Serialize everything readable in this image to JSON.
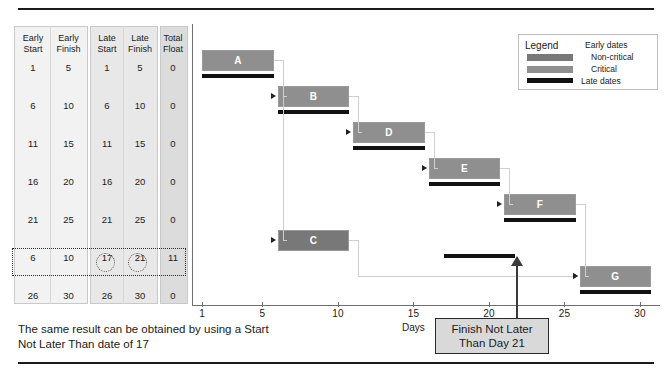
{
  "table": {
    "groups": [
      {
        "name": "early",
        "headers": [
          "Early Start",
          "Early Finish"
        ]
      },
      {
        "name": "late",
        "headers": [
          "Late Start",
          "Late Finish"
        ]
      },
      {
        "name": "float",
        "headers": [
          "Total Float"
        ]
      }
    ],
    "headers": {
      "early_start_l1": "Early",
      "early_start_l2": "Start",
      "early_finish_l1": "Early",
      "early_finish_l2": "Finish",
      "late_start_l1": "Late",
      "late_start_l2": "Start",
      "late_finish_l1": "Late",
      "late_finish_l2": "Finish",
      "total_float_l1": "Total",
      "total_float_l2": "Float"
    },
    "rows": [
      {
        "task": "A",
        "early_start": "1",
        "early_finish": "5",
        "late_start": "1",
        "late_finish": "5",
        "total_float": "0",
        "highlighted": false
      },
      {
        "task": "B",
        "early_start": "6",
        "early_finish": "10",
        "late_start": "6",
        "late_finish": "10",
        "total_float": "0",
        "highlighted": false
      },
      {
        "task": "D",
        "early_start": "11",
        "early_finish": "15",
        "late_start": "11",
        "late_finish": "15",
        "total_float": "0",
        "highlighted": false
      },
      {
        "task": "E",
        "early_start": "16",
        "early_finish": "20",
        "late_start": "16",
        "late_finish": "20",
        "total_float": "0",
        "highlighted": false
      },
      {
        "task": "F",
        "early_start": "21",
        "early_finish": "25",
        "late_start": "21",
        "late_finish": "25",
        "total_float": "0",
        "highlighted": false
      },
      {
        "task": "C",
        "early_start": "6",
        "early_finish": "10",
        "late_start": "17",
        "late_finish": "21",
        "total_float": "11",
        "highlighted": true
      },
      {
        "task": "G",
        "early_start": "26",
        "early_finish": "30",
        "late_start": "26",
        "late_finish": "30",
        "total_float": "0",
        "highlighted": false
      }
    ]
  },
  "legend": {
    "title": "Legend",
    "early_dates": "Early dates",
    "non_critical": "Non-critical",
    "critical": "Critical",
    "late_dates": "Late dates",
    "color_non_critical": "#787878",
    "color_critical": "#8f8f8f",
    "color_late": "#111111"
  },
  "callout": {
    "line1": "Finish Not Later",
    "line2": "Than Day 21"
  },
  "note": {
    "line1": "The same result can be obtained by using a",
    "line2": "Start Not Later Than date of 17"
  },
  "chart_data": {
    "type": "bar",
    "title": "",
    "xlabel": "Days",
    "ylabel": "",
    "xlim": [
      1,
      30
    ],
    "grid": false,
    "legend_position": "top-right",
    "axis_ticks": [
      "1",
      "5",
      "10",
      "15",
      "20",
      "25",
      "30"
    ],
    "axis_tick_values": [
      1,
      5,
      10,
      15,
      20,
      25,
      30
    ],
    "tasks": [
      {
        "name": "A",
        "early_start": 1,
        "early_finish": 5,
        "late_start": 1,
        "late_finish": 5,
        "total_float": 0,
        "critical": true
      },
      {
        "name": "B",
        "early_start": 6,
        "early_finish": 10,
        "late_start": 6,
        "late_finish": 10,
        "total_float": 0,
        "critical": true
      },
      {
        "name": "D",
        "early_start": 11,
        "early_finish": 15,
        "late_start": 11,
        "late_finish": 15,
        "total_float": 0,
        "critical": true
      },
      {
        "name": "E",
        "early_start": 16,
        "early_finish": 20,
        "late_start": 16,
        "late_finish": 20,
        "total_float": 0,
        "critical": true
      },
      {
        "name": "F",
        "early_start": 21,
        "early_finish": 25,
        "late_start": 21,
        "late_finish": 25,
        "total_float": 0,
        "critical": true
      },
      {
        "name": "C",
        "early_start": 6,
        "early_finish": 10,
        "late_start": 17,
        "late_finish": 21,
        "total_float": 11,
        "critical": false
      },
      {
        "name": "G",
        "early_start": 26,
        "early_finish": 30,
        "late_start": 26,
        "late_finish": 30,
        "total_float": 0,
        "critical": true
      }
    ],
    "dependencies": [
      [
        "A",
        "B"
      ],
      [
        "B",
        "D"
      ],
      [
        "D",
        "E"
      ],
      [
        "E",
        "F"
      ],
      [
        "A",
        "C"
      ],
      [
        "C",
        "G"
      ],
      [
        "F",
        "G"
      ]
    ],
    "constraint": {
      "task": "C",
      "type": "Finish Not Later Than",
      "day": 21
    }
  }
}
